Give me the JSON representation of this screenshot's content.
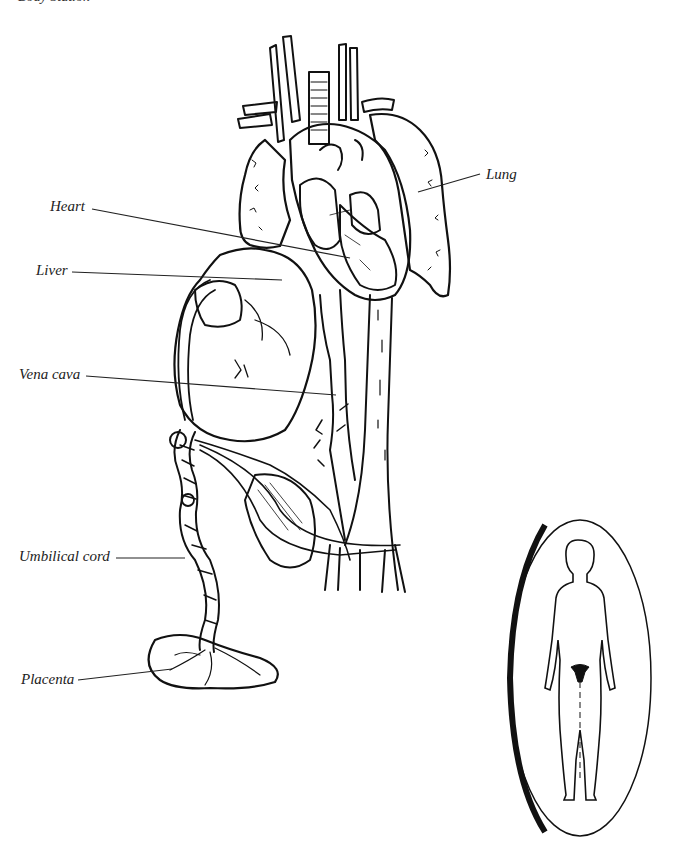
{
  "page": {
    "clipped_heading": "Body Station"
  },
  "labels": {
    "heart": "Heart",
    "liver": "Liver",
    "vena_cava": "Vena cava",
    "umbilical_cord": "Umbilical cord",
    "placenta": "Placenta",
    "lung": "Lung"
  },
  "inset": {
    "description": "Female body silhouette with uterus highlighted"
  },
  "colors": {
    "ink": "#111111",
    "background": "#ffffff"
  }
}
